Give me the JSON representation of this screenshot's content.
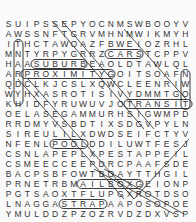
{
  "puzzle": {
    "type": "word-search",
    "rows": [
      "SUIPSSEPYOCNMSWBOOYV",
      "AWSSNFTGRVMHNMWIKMYH",
      "ITHCTAWOAZFBWEIOZRHL",
      "MNTYRPYGRRZCARSTCPPV",
      "HAASUBURBEAOLDTAWLQL",
      "ARPROXIMITYGOITSOAFN",
      "QDCLKJCSLXQWCLEENRIW",
      "WYHXASROTISIVYDMMTGO",
      "KHIDFYRUWUVJOTRANSIT",
      "OELASEGAMMURHSIGWMPD",
      "RRDMYVSBDTIXSDGVPYLN",
      "SIREULILXDWDSEIFCTYV",
      "NFENLPOOLDDILUWTFESJ",
      "CSNLAPEPLXPESTAPPEIL",
      "CSMEECCEEPDRCPAAFSDE",
      "BACPSBFOWTBOAYTTHGIL",
      "PRNETRBMAILBOXGEIONP",
      "PGTSAOXTFLUPGXROTDSO",
      "LNAGGASTRAPAAPOSOPOE",
      "YMULDDZPZOZRVDZDXVSP"
    ],
    "found_words": [
      "SUBURB",
      "PROXIMITY",
      "CARS",
      "TRANSIT",
      "MAILBOX",
      "POOL",
      "STRAP",
      "SIDEWALK"
    ]
  }
}
